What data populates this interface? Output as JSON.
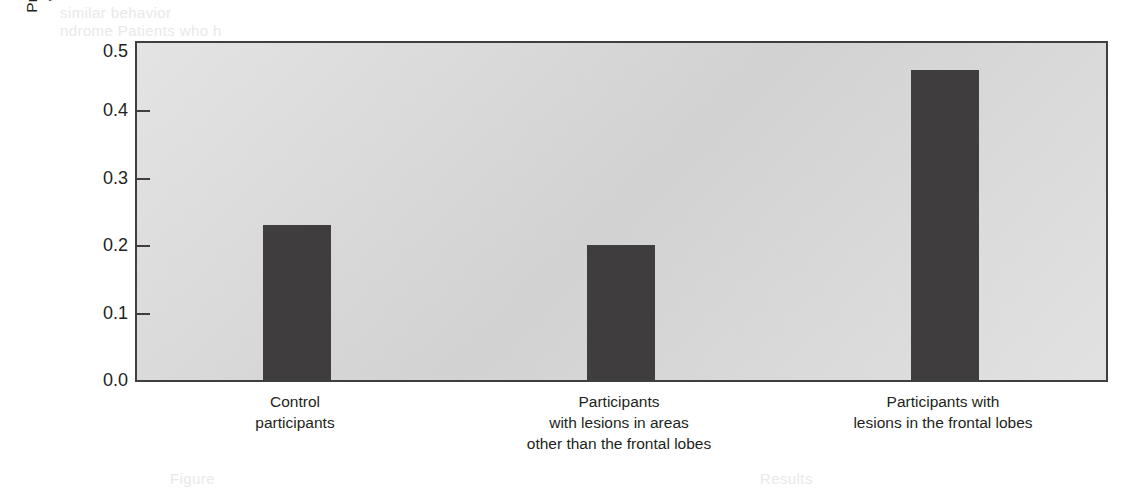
{
  "chart_data": {
    "type": "bar",
    "title": "",
    "xlabel": "",
    "ylabel": "Proportion of participants who engaged in harm",
    "ylabel_lines": [
      "Proportion of participants",
      "who engaged in harm"
    ],
    "categories": [
      "Control participants",
      "Participants with lesions in areas other than the frontal lobes",
      "Participants with lesions in the frontal lobes"
    ],
    "category_lines": [
      [
        "Control",
        "participants"
      ],
      [
        "Participants",
        "with lesions in areas",
        "other than the frontal lobes"
      ],
      [
        "Participants with",
        "lesions in the frontal lobes"
      ]
    ],
    "values": [
      0.23,
      0.2,
      0.46
    ],
    "ylim": [
      0.0,
      0.5
    ],
    "ytick_values": [
      0.0,
      0.1,
      0.2,
      0.3,
      0.4,
      0.5
    ],
    "ytick_labels": [
      "0.0",
      "0.1",
      "0.2",
      "0.3",
      "0.4",
      "0.5"
    ],
    "grid": false,
    "legend": false,
    "bar_color": "#3f3d3d",
    "plot_background_color": "#d7d7d7",
    "axis_color": "#3f3f3f",
    "text_color": "#231f20",
    "bar_positions_px": [
      {
        "left": 126,
        "width": 68
      },
      {
        "left": 450,
        "width": 68
      },
      {
        "left": 774,
        "width": 68
      }
    ],
    "category_centers_px": [
      160,
      484,
      808
    ]
  },
  "ghost_text": {
    "top_lines": [
      "similar behavior",
      "ndrome Patients who h"
    ],
    "bottom_lines": [
      "Figure",
      "Results"
    ]
  }
}
